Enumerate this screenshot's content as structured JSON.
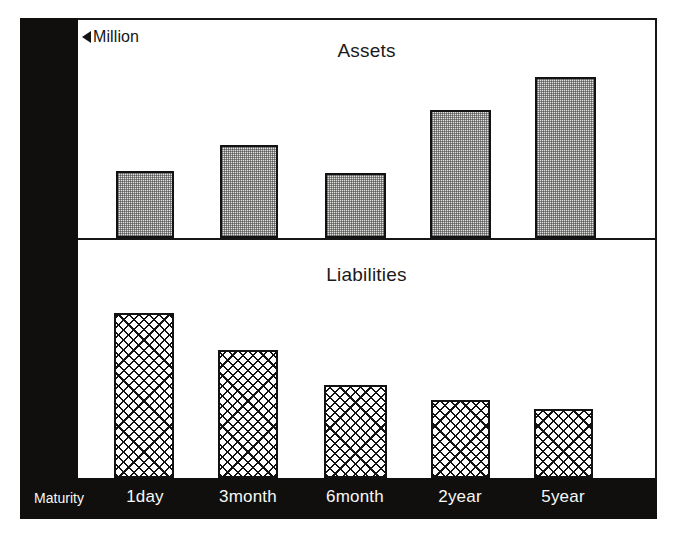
{
  "figure": {
    "unit_note": "Million",
    "unit_marker_icon": "left-triangle-icon",
    "axis_name": "Maturity"
  },
  "panels": [
    {
      "key": "assets",
      "title": "Assets"
    },
    {
      "key": "liabilities",
      "title": "Liabilities"
    }
  ],
  "colors": {
    "frame": "#171616",
    "band": "#100f0d",
    "bar_outline": "#131212",
    "assets_fill": "#e2e2e0",
    "liabilities_fill": "#ffffff",
    "label_text": "#f7f7f5",
    "title_text": "#1b1a1a"
  },
  "chart_data": {
    "type": "bar",
    "xlabel": "Maturity",
    "ylabel": "Million",
    "grid": false,
    "legend": "none",
    "categories": [
      "1day",
      "3month",
      "6month",
      "2year",
      "5year"
    ],
    "panels": [
      {
        "name": "Assets",
        "baseline_px": 238,
        "top_px": 18,
        "fill": "stipple",
        "values": [
          67,
          93,
          65,
          128,
          161
        ],
        "ylim": [
          0,
          220
        ],
        "bars": [
          {
            "category": "1day",
            "value": 67,
            "x_px": 116,
            "width_px": 58,
            "top_px": 171
          },
          {
            "category": "3month",
            "value": 93,
            "x_px": 220,
            "width_px": 58,
            "top_px": 145
          },
          {
            "category": "6month",
            "value": 65,
            "x_px": 325,
            "width_px": 61,
            "top_px": 173
          },
          {
            "category": "2year",
            "value": 128,
            "x_px": 430,
            "width_px": 61,
            "top_px": 110
          },
          {
            "category": "5year",
            "value": 161,
            "x_px": 535,
            "width_px": 61,
            "top_px": 77
          }
        ]
      },
      {
        "name": "Liabilities",
        "baseline_px": 478,
        "top_px": 240,
        "fill": "lattice",
        "values": [
          165,
          128,
          93,
          78,
          69
        ],
        "ylim": [
          0,
          238
        ],
        "bars": [
          {
            "category": "1day",
            "value": 165,
            "x_px": 114,
            "width_px": 60,
            "top_px": 313
          },
          {
            "category": "3month",
            "value": 128,
            "x_px": 218,
            "width_px": 60,
            "top_px": 350
          },
          {
            "category": "6month",
            "value": 93,
            "x_px": 324,
            "width_px": 63,
            "top_px": 385
          },
          {
            "category": "2year",
            "value": 78,
            "x_px": 431,
            "width_px": 59,
            "top_px": 400
          },
          {
            "category": "5year",
            "value": 69,
            "x_px": 534,
            "width_px": 59,
            "top_px": 409
          }
        ]
      }
    ],
    "tick_labels": [
      {
        "text": "1day",
        "center_px": 145
      },
      {
        "text": "3month",
        "center_px": 248
      },
      {
        "text": "6month",
        "center_px": 355
      },
      {
        "text": "2year",
        "center_px": 460
      },
      {
        "text": "5year",
        "center_px": 563
      }
    ]
  }
}
